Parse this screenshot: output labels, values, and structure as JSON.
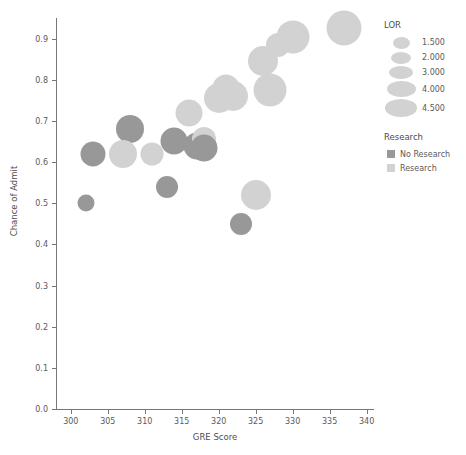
{
  "chart_data": {
    "type": "scatter",
    "title": "",
    "xlabel": "GRE Score",
    "ylabel": "Chance of Admit",
    "xlim": [
      298,
      341
    ],
    "ylim": [
      0.0,
      0.95
    ],
    "xticks": [
      "300",
      "305",
      "310",
      "315",
      "320",
      "325",
      "330",
      "335",
      "340"
    ],
    "xtick_values": [
      300,
      305,
      310,
      315,
      320,
      325,
      330,
      335,
      340
    ],
    "yticks": [
      "0.0",
      "0.1",
      "0.2",
      "0.3",
      "0.4",
      "0.5",
      "0.6",
      "0.7",
      "0.8",
      "0.9"
    ],
    "ytick_values": [
      0.0,
      0.1,
      0.2,
      0.3,
      0.4,
      0.5,
      0.6,
      0.7,
      0.8,
      0.9
    ],
    "grid": false,
    "size_encoding": "LOR",
    "color_encoding": "Research",
    "colors": {
      "no_research": "#989898",
      "research": "#d2d2d2"
    },
    "points": [
      {
        "x": 302,
        "y": 0.5,
        "lor": 1.5,
        "research": "No Research",
        "r": 8.5
      },
      {
        "x": 303,
        "y": 0.62,
        "lor": 3.0,
        "research": "No Research",
        "r": 12.5
      },
      {
        "x": 308,
        "y": 0.68,
        "lor": 3.5,
        "research": "No Research",
        "r": 14.0
      },
      {
        "x": 307,
        "y": 0.62,
        "lor": 3.5,
        "research": "Research",
        "r": 14.0
      },
      {
        "x": 311,
        "y": 0.62,
        "lor": 2.5,
        "research": "Research",
        "r": 11.5
      },
      {
        "x": 313,
        "y": 0.54,
        "lor": 2.5,
        "research": "No Research",
        "r": 11.0
      },
      {
        "x": 314,
        "y": 0.65,
        "lor": 3.5,
        "research": "No Research",
        "r": 13.5
      },
      {
        "x": 316,
        "y": 0.72,
        "lor": 3.5,
        "research": "Research",
        "r": 13.5
      },
      {
        "x": 317,
        "y": 0.64,
        "lor": 3.5,
        "research": "No Research",
        "r": 13.5
      },
      {
        "x": 318,
        "y": 0.655,
        "lor": 3.0,
        "research": "Research",
        "r": 12.0
      },
      {
        "x": 318,
        "y": 0.635,
        "lor": 3.5,
        "research": "No Research",
        "r": 13.5
      },
      {
        "x": 320,
        "y": 0.755,
        "lor": 4.0,
        "research": "Research",
        "r": 15.0
      },
      {
        "x": 321,
        "y": 0.78,
        "lor": 3.5,
        "research": "Research",
        "r": 13.5
      },
      {
        "x": 322,
        "y": 0.76,
        "lor": 4.0,
        "research": "Research",
        "r": 15.0
      },
      {
        "x": 323,
        "y": 0.45,
        "lor": 2.5,
        "research": "No Research",
        "r": 11.0
      },
      {
        "x": 325,
        "y": 0.52,
        "lor": 4.0,
        "research": "Research",
        "r": 15.0
      },
      {
        "x": 326,
        "y": 0.845,
        "lor": 4.0,
        "research": "Research",
        "r": 15.0
      },
      {
        "x": 327,
        "y": 0.775,
        "lor": 4.5,
        "research": "Research",
        "r": 16.5
      },
      {
        "x": 328,
        "y": 0.885,
        "lor": 3.0,
        "research": "Research",
        "r": 12.0
      },
      {
        "x": 330,
        "y": 0.905,
        "lor": 4.5,
        "research": "Research",
        "r": 16.5
      },
      {
        "x": 337,
        "y": 0.925,
        "lor": 4.5,
        "research": "Research",
        "r": 17.5
      }
    ],
    "legend": {
      "position": "right",
      "size_legend": {
        "title": "LOR",
        "entries": [
          {
            "label": "1.500",
            "value": 1.5,
            "r": 8.5
          },
          {
            "label": "2.000",
            "value": 2.0,
            "r": 10.0
          },
          {
            "label": "3.000",
            "value": 3.0,
            "r": 12.0
          },
          {
            "label": "4.000",
            "value": 4.0,
            "r": 14.5
          },
          {
            "label": "4.500",
            "value": 4.5,
            "r": 16.0
          }
        ]
      },
      "color_legend": {
        "title": "Research",
        "entries": [
          {
            "label": "No Research",
            "color": "#989898"
          },
          {
            "label": "Research",
            "color": "#d2d2d2"
          }
        ]
      }
    }
  }
}
